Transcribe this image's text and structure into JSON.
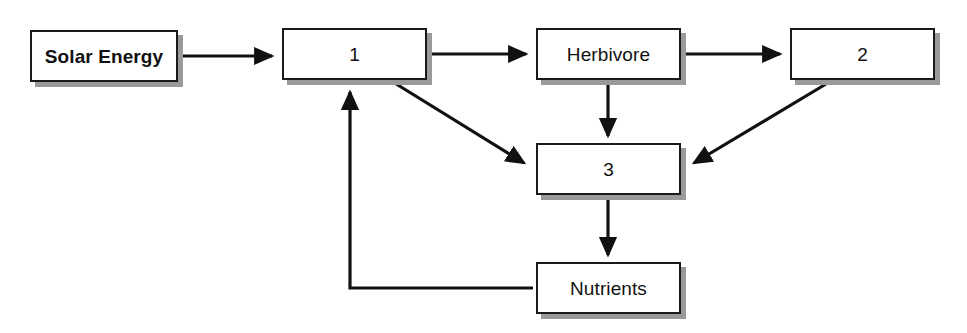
{
  "diagram": {
    "type": "flow-diagram",
    "title_partial_cutoff": "",
    "background_color": "#ffffff",
    "box_border_color": "#1a1a1a",
    "box_shadow_color": "#9a9a9a",
    "arrow_color": "#111111",
    "nodes": [
      {
        "id": "solar-energy",
        "label": "Solar Energy",
        "bold": true,
        "x": 30,
        "y": 30,
        "w": 148,
        "h": 52
      },
      {
        "id": "producer-1",
        "label": "1",
        "bold": false,
        "x": 282,
        "y": 28,
        "w": 145,
        "h": 52
      },
      {
        "id": "herbivore",
        "label": "Herbivore",
        "bold": false,
        "x": 536,
        "y": 28,
        "w": 145,
        "h": 52
      },
      {
        "id": "consumer-2",
        "label": "2",
        "bold": false,
        "x": 790,
        "y": 28,
        "w": 145,
        "h": 52
      },
      {
        "id": "decomposer-3",
        "label": "3",
        "bold": false,
        "x": 536,
        "y": 143,
        "w": 145,
        "h": 52
      },
      {
        "id": "nutrients",
        "label": "Nutrients",
        "bold": false,
        "x": 536,
        "y": 262,
        "w": 145,
        "h": 52
      }
    ],
    "edges": [
      {
        "id": "solar-to-1",
        "from": "solar-energy",
        "to": "producer-1",
        "style": "straight-horizontal"
      },
      {
        "id": "1-to-herbivore",
        "from": "producer-1",
        "to": "herbivore",
        "style": "straight-horizontal"
      },
      {
        "id": "herbivore-to-2",
        "from": "herbivore",
        "to": "consumer-2",
        "style": "straight-horizontal"
      },
      {
        "id": "herbivore-to-3",
        "from": "herbivore",
        "to": "decomposer-3",
        "style": "straight-vertical"
      },
      {
        "id": "1-to-3",
        "from": "producer-1",
        "to": "decomposer-3",
        "style": "diagonal"
      },
      {
        "id": "2-to-3",
        "from": "consumer-2",
        "to": "decomposer-3",
        "style": "diagonal"
      },
      {
        "id": "3-to-nutrients",
        "from": "decomposer-3",
        "to": "nutrients",
        "style": "straight-vertical"
      },
      {
        "id": "nutrients-to-1",
        "from": "nutrients",
        "to": "producer-1",
        "style": "elbow-feedback"
      }
    ]
  }
}
